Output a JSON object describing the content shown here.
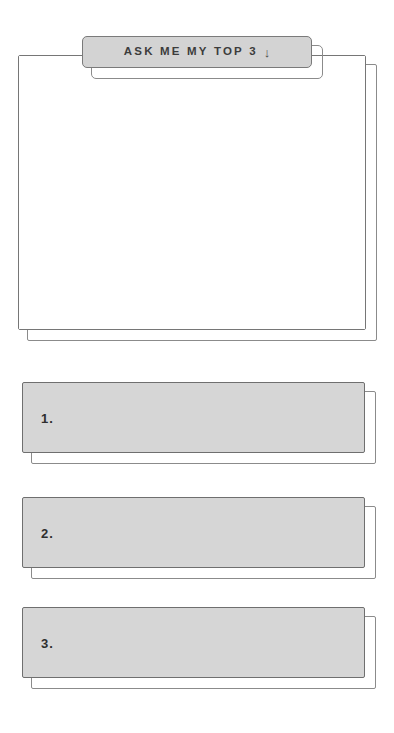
{
  "page": {
    "background_color": "#ffffff",
    "width": 394,
    "height": 733
  },
  "header_tab": {
    "label": "ASK ME MY TOP 3",
    "arrow_glyph": "↓",
    "arrow_icon_name": "arrow-down-icon",
    "fill_color": "#d3d3d3",
    "border_color": "#7a7a7a",
    "text_color": "#3c3c3c"
  },
  "note_card": {
    "content": "",
    "fill_color": "#ffffff",
    "border_color": "#767676"
  },
  "answer_bars": [
    {
      "number": "1.",
      "value": "",
      "fill_color": "#d6d6d6",
      "border_color": "#6f6f6f"
    },
    {
      "number": "2.",
      "value": "",
      "fill_color": "#d6d6d6",
      "border_color": "#6f6f6f"
    },
    {
      "number": "3.",
      "value": "",
      "fill_color": "#d6d6d6",
      "border_color": "#6f6f6f"
    }
  ]
}
